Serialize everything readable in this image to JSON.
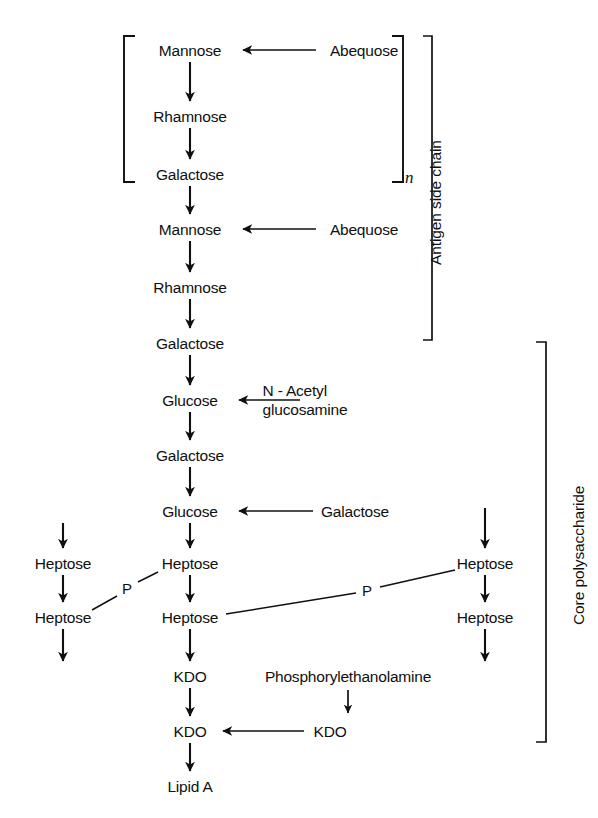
{
  "diagram": {
    "type": "biochemical-pathway-diagram",
    "background_color": "#ffffff",
    "line_color": "#101010",
    "repeat_subscript": "n",
    "region_labels": {
      "antigen_side_chain": "Antigen side chain",
      "core_polysaccharide": "Core polysaccharide"
    },
    "main_chain": [
      {
        "id": "m1",
        "label": "Mannose",
        "x": 190,
        "y": 50,
        "in_repeat": true
      },
      {
        "id": "m2",
        "label": "Rhamnose",
        "x": 190,
        "y": 116,
        "in_repeat": true
      },
      {
        "id": "m3",
        "label": "Galactose",
        "x": 190,
        "y": 174,
        "in_repeat": true
      },
      {
        "id": "m4",
        "label": "Mannose",
        "x": 190,
        "y": 229,
        "in_repeat": false
      },
      {
        "id": "m5",
        "label": "Rhamnose",
        "x": 190,
        "y": 287,
        "in_repeat": false
      },
      {
        "id": "m6",
        "label": "Galactose",
        "x": 190,
        "y": 343,
        "in_repeat": false
      },
      {
        "id": "m7",
        "label": "Glucose",
        "x": 190,
        "y": 400,
        "in_repeat": false
      },
      {
        "id": "m8",
        "label": "Galactose",
        "x": 190,
        "y": 455,
        "in_repeat": false
      },
      {
        "id": "m9",
        "label": "Glucose",
        "x": 190,
        "y": 511,
        "in_repeat": false
      },
      {
        "id": "m10",
        "label": "Heptose",
        "x": 190,
        "y": 563,
        "in_repeat": false
      },
      {
        "id": "m11",
        "label": "Heptose",
        "x": 190,
        "y": 617,
        "in_repeat": false
      },
      {
        "id": "m12",
        "label": "KDO",
        "x": 190,
        "y": 676,
        "in_repeat": false
      },
      {
        "id": "m13",
        "label": "KDO",
        "x": 190,
        "y": 731,
        "in_repeat": false
      },
      {
        "id": "m14",
        "label": "Lipid A",
        "x": 190,
        "y": 786,
        "in_repeat": false
      }
    ],
    "left_branch": [
      {
        "id": "l1",
        "label": "Heptose",
        "x": 63,
        "y": 563
      },
      {
        "id": "l2",
        "label": "Heptose",
        "x": 63,
        "y": 617
      }
    ],
    "right_branch": [
      {
        "id": "r1",
        "label": "Heptose",
        "x": 485,
        "y": 563
      },
      {
        "id": "r2",
        "label": "Heptose",
        "x": 485,
        "y": 617
      }
    ],
    "side_substituents": [
      {
        "id": "s1",
        "label": "Abequose",
        "x": 364,
        "y": 50,
        "target": "Mannose"
      },
      {
        "id": "s2",
        "label": "Abequose",
        "x": 364,
        "y": 229,
        "target": "Mannose"
      },
      {
        "id": "s3",
        "label_line1": "N - Acetyl",
        "label_line2": "glucosamine",
        "x": 305,
        "y": 392,
        "target": "Glucose"
      },
      {
        "id": "s4",
        "label": "Galactose",
        "x": 355,
        "y": 511,
        "target": "Glucose"
      },
      {
        "id": "s5",
        "label": "KDO",
        "x": 330,
        "y": 731,
        "target": "KDO"
      },
      {
        "id": "s6",
        "label": "Phosphorylethanolamine",
        "x": 348,
        "y": 676,
        "target": "KDO"
      }
    ],
    "phosphate_bridges": [
      {
        "id": "p1",
        "label": "P",
        "x": 127,
        "y": 588,
        "connects": [
          "Heptose (center, upper)",
          "Heptose (left, lower)"
        ]
      },
      {
        "id": "p2",
        "label": "P",
        "x": 367,
        "y": 590,
        "connects": [
          "Heptose (center, lower)",
          "Heptose (right, upper)"
        ]
      }
    ]
  }
}
